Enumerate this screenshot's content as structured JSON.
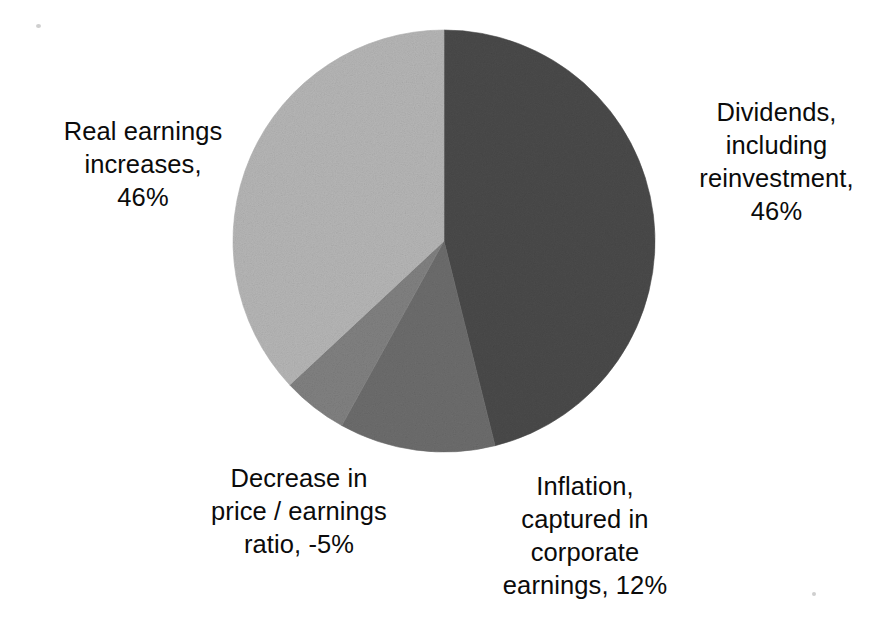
{
  "chart_data": {
    "type": "pie",
    "title": "",
    "subtitle": "",
    "xlabel": "",
    "ylabel": "",
    "legend_position": "none",
    "grid": false,
    "labels_position": "outside",
    "start_angle_deg": 0,
    "direction": "clockwise",
    "categories": [
      "Dividends, including reinvestment",
      "Inflation, captured in corporate earnings",
      "Decrease in price / earnings ratio",
      "Real earnings increases"
    ],
    "values": [
      46,
      12,
      -5,
      46
    ],
    "value_suffix": "%",
    "slices": [
      {
        "name": "dividends",
        "category": "Dividends, including reinvestment",
        "value": 46,
        "value_text": "46%",
        "color": "#4a4a4a",
        "start_angle_deg": 0,
        "end_angle_deg": 166
      },
      {
        "name": "inflation",
        "category": "Inflation, captured in corporate earnings",
        "value": 12,
        "value_text": "12%",
        "color": "#6d6d6d",
        "start_angle_deg": 166,
        "end_angle_deg": 209
      },
      {
        "name": "decrease-pe",
        "category": "Decrease in price / earnings ratio",
        "value": -5,
        "value_text": "-5%",
        "color": "#818181",
        "start_angle_deg": 209,
        "end_angle_deg": 227
      },
      {
        "name": "real-earnings",
        "category": "Real earnings increases",
        "value": 46,
        "value_text": "46%",
        "color": "#b6b6b6",
        "start_angle_deg": 227,
        "end_angle_deg": 360
      }
    ],
    "annotations": [
      {
        "name": "real-earnings",
        "text": "Real earnings\nincreases,\n46%",
        "placement": "left"
      },
      {
        "name": "dividends",
        "text": "Dividends,\nincluding\nreinvestment,\n46%",
        "placement": "right"
      },
      {
        "name": "decrease-pe",
        "text": "Decrease in\nprice / earnings\nratio, -5%",
        "placement": "bottom-left"
      },
      {
        "name": "inflation",
        "text": "Inflation,\ncaptured in\ncorporate\nearnings, 12%",
        "placement": "bottom-right"
      }
    ]
  },
  "labels": {
    "real_earnings": "Real earnings\nincreases,\n46%",
    "dividends": "Dividends,\nincluding\nreinvestment,\n46%",
    "decrease_pe": "Decrease in\nprice / earnings\nratio, -5%",
    "inflation": "Inflation,\ncaptured in\ncorporate\nearnings, 12%"
  },
  "colors": {
    "background": "#ffffff",
    "text": "#0b0b0b",
    "slice_dividends": "#4a4a4a",
    "slice_inflation": "#6d6d6d",
    "slice_decrease_pe": "#818181",
    "slice_real_earnings": "#b6b6b6"
  },
  "geometry": {
    "center_x": 444,
    "center_y": 241,
    "radius": 211
  }
}
